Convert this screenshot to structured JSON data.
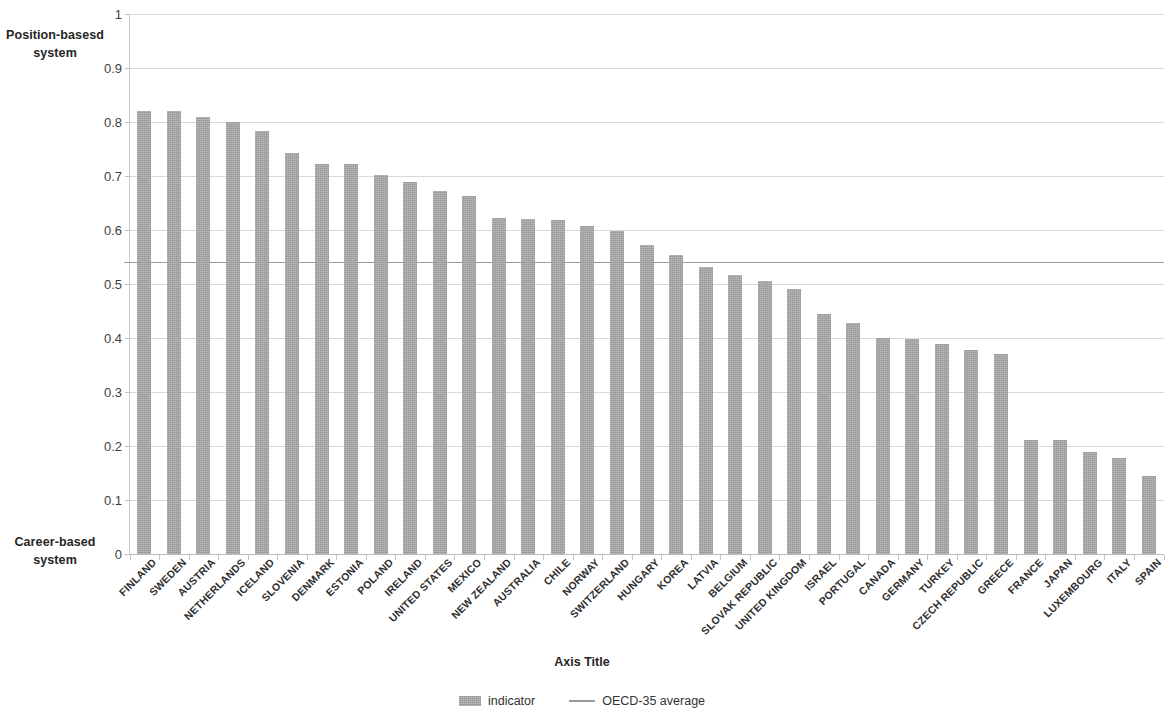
{
  "annotations": {
    "top_label": "Position-basesd system",
    "bottom_label": "Career-based system"
  },
  "axis_title": "Axis Title",
  "legend": [
    {
      "label": "indicator",
      "marker": "bar-swatch",
      "color": "#a8a8a8"
    },
    {
      "label": "OECD-35 average",
      "marker": "line-swatch",
      "color": "#9b9b9b"
    }
  ],
  "chart_data": {
    "type": "bar",
    "title": "",
    "subtitle": "",
    "xlabel": "Axis Title",
    "ylabel": "",
    "ylim": [
      0,
      1
    ],
    "yticks": [
      "0",
      "0.1",
      "0.2",
      "0.3",
      "0.4",
      "0.5",
      "0.6",
      "0.7",
      "0.8",
      "0.9",
      "1"
    ],
    "grid": true,
    "legend_position": "bottom",
    "categories": [
      "FINLAND",
      "SWEDEN",
      "AUSTRIA",
      "NETHERLANDS",
      "ICELAND",
      "SLOVENIA",
      "DENMARK",
      "ESTONIA",
      "POLAND",
      "IRELAND",
      "UNITED STATES",
      "MEXICO",
      "NEW ZEALAND",
      "AUSTRALIA",
      "CHILE",
      "NORWAY",
      "SWITZERLAND",
      "HUNGARY",
      "KOREA",
      "LATVIA",
      "BELGIUM",
      "SLOVAK REPUBLIC",
      "UNITED KINGDOM",
      "ISRAEL",
      "PORTUGAL",
      "CANADA",
      "GERMANY",
      "TURKEY",
      "CZECH REPUBLIC",
      "GREECE",
      "FRANCE",
      "JAPAN",
      "LUXEMBOURG",
      "ITALY",
      "SPAIN"
    ],
    "series": [
      {
        "name": "indicator",
        "type": "bar",
        "color": "#a8a8a8",
        "values": [
          0.82,
          0.82,
          0.81,
          0.8,
          0.783,
          0.743,
          0.723,
          0.723,
          0.702,
          0.688,
          0.673,
          0.663,
          0.623,
          0.62,
          0.619,
          0.607,
          0.598,
          0.572,
          0.553,
          0.531,
          0.516,
          0.506,
          0.491,
          0.444,
          0.427,
          0.4,
          0.398,
          0.388,
          0.378,
          0.37,
          0.212,
          0.211,
          0.188,
          0.178,
          0.145
        ]
      },
      {
        "name": "OECD-35 average",
        "type": "line",
        "color": "#9b9b9b",
        "value": 0.54
      }
    ]
  }
}
